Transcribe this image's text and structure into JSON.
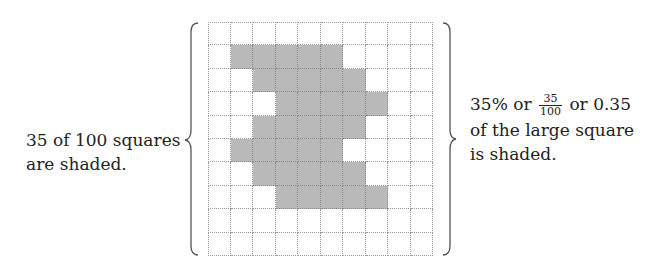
{
  "grid": {
    "rows": 10,
    "cols": 10,
    "shaded_colors": {
      "fill": "#b9b9b9",
      "grid_line": "#9a9a9a"
    },
    "shaded_cells_by_row": [
      [],
      [
        1,
        2,
        3,
        4,
        5
      ],
      [
        2,
        3,
        4,
        5,
        6
      ],
      [
        3,
        4,
        5,
        6,
        7
      ],
      [
        2,
        3,
        4,
        5,
        6
      ],
      [
        1,
        2,
        3,
        4,
        5
      ],
      [
        2,
        3,
        4,
        5,
        6
      ],
      [
        3,
        4,
        5,
        6,
        7
      ],
      [],
      []
    ],
    "shaded_count": 35,
    "total_count": 100
  },
  "left_label": {
    "line1": "35 of 100 squares",
    "line2": "are shaded."
  },
  "right_label": {
    "percent": "35% or",
    "fraction_numerator": "35",
    "fraction_denominator": "100",
    "decimal": "or 0.35",
    "line2": "of the large square",
    "line3": "is shaded."
  }
}
